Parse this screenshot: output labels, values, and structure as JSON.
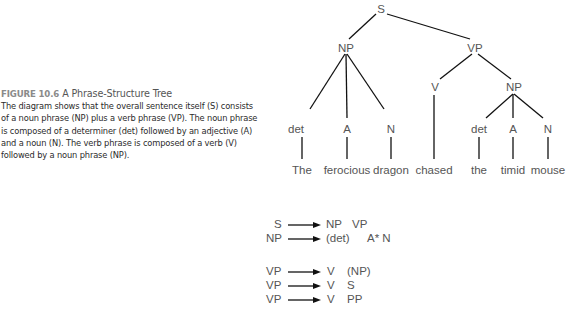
{
  "caption": {
    "figure_label": "FIGURE 10.6",
    "figure_title": "A Phrase-Structure Tree",
    "body": "The diagram shows that the overall sentence itself (S) consists of a noun phrase (NP) plus a verb phrase (VP). The noun phrase is composed of a determiner (det) followed by an adjective (A) and a noun (N). The verb phrase is composed of a verb (V) followed by a noun phrase (NP)."
  },
  "tree": {
    "root": "S",
    "np_left": "NP",
    "vp": "VP",
    "v": "V",
    "np_right": "NP",
    "left_cats": [
      "det",
      "A",
      "N"
    ],
    "right_cats": [
      "det",
      "A",
      "N"
    ],
    "words": [
      "The",
      "ferocious",
      "dragon",
      "chased",
      "the",
      "timid",
      "mouse"
    ]
  },
  "rules": [
    {
      "lhs": "S",
      "rhs": [
        "NP",
        "VP"
      ]
    },
    {
      "lhs": "NP",
      "rhs": [
        "(det)",
        "A* N"
      ]
    },
    {
      "lhs": "VP",
      "rhs": [
        "V",
        "(NP)"
      ]
    },
    {
      "lhs": "VP",
      "rhs": [
        "V",
        "S"
      ]
    },
    {
      "lhs": "VP",
      "rhs": [
        "V",
        "PP"
      ]
    }
  ]
}
